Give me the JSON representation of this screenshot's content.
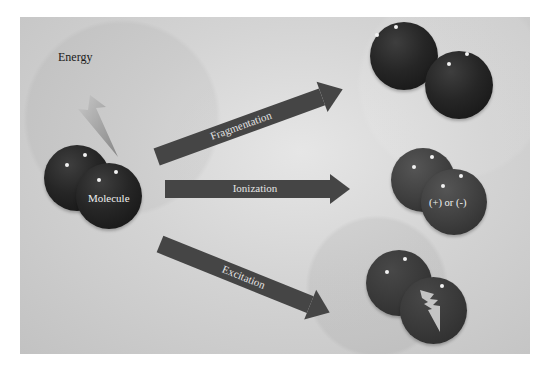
{
  "diagram": {
    "energy_label": "Energy",
    "molecule_label": "Molecule",
    "processes": [
      {
        "name": "fragmentation",
        "label": "Fragmentation"
      },
      {
        "name": "ionization",
        "label": "Ionization"
      },
      {
        "name": "excitation",
        "label": "Excitation"
      }
    ],
    "ion_label": "(+) or (-)",
    "icons": {
      "energy": "lightning-bolt",
      "excited": "lightning-bolt"
    },
    "colors": {
      "background": "#d0d0d0",
      "arrow": "#454545",
      "sphere_dark": "#1e1e1e",
      "sphere_ion": "#404040",
      "sphere_excited": "#383838",
      "text_light": "#f0f0f0"
    }
  }
}
